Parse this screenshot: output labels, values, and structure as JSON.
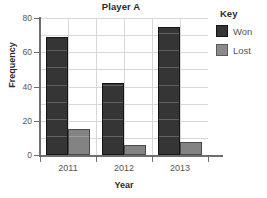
{
  "chart_data": {
    "type": "bar",
    "title": "Player A",
    "xlabel": "Year",
    "ylabel": "Frequency",
    "categories": [
      "2011",
      "2012",
      "2013"
    ],
    "series": [
      {
        "name": "Won",
        "color": "#353535",
        "values": [
          69,
          42,
          75
        ]
      },
      {
        "name": "Lost",
        "color": "#838383",
        "values": [
          15,
          6,
          7.5
        ]
      }
    ],
    "ylim": [
      0,
      80
    ],
    "yticks": [
      0,
      20,
      40,
      60,
      80
    ],
    "ytick_labels": [
      "0",
      "20",
      "40",
      "60",
      "80"
    ],
    "grid": true,
    "grid_minor_step": 10,
    "legend_position": "right",
    "legend_title": "Key"
  }
}
